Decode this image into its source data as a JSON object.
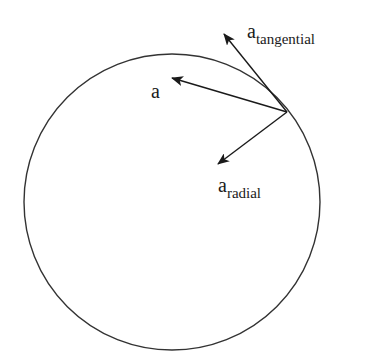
{
  "diagram": {
    "type": "circular-motion-acceleration",
    "colors": {
      "stroke": "#333333",
      "text": "#1a1a1a",
      "background": "#ffffff"
    },
    "circle": {
      "cx": 172,
      "cy": 202,
      "r": 148
    },
    "origin_point": {
      "x": 287,
      "y": 112
    },
    "vectors": [
      {
        "id": "a",
        "label": "a",
        "subscript": "",
        "tip": {
          "x": 172,
          "y": 78
        }
      },
      {
        "id": "a_tangential",
        "label": "a",
        "subscript": "tangential",
        "tip": {
          "x": 224,
          "y": 34
        }
      },
      {
        "id": "a_radial",
        "label": "a",
        "subscript": "radial",
        "tip": {
          "x": 218,
          "y": 164
        }
      }
    ]
  },
  "labels": {
    "a": {
      "base": "a"
    },
    "tangential": {
      "base": "a",
      "sub": "tangential"
    },
    "radial": {
      "base": "a",
      "sub": "radial"
    }
  }
}
